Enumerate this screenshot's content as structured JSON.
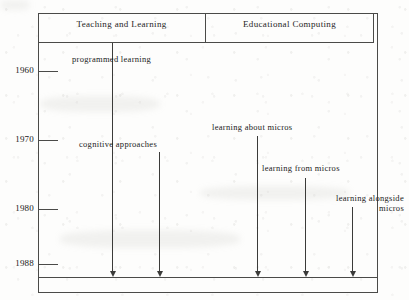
{
  "figure": {
    "type": "timeline-diagram",
    "columns": [
      {
        "id": "teaching-and-learning",
        "label": "Teaching and Learning"
      },
      {
        "id": "educational-computing",
        "label": "Educational Computing"
      }
    ],
    "axis": {
      "orientation": "vertical",
      "label": "",
      "ticks": [
        {
          "year": "1960",
          "y": 71
        },
        {
          "year": "1970",
          "y": 140
        },
        {
          "year": "1980",
          "y": 209
        },
        {
          "year": "1988",
          "y": 264
        }
      ],
      "range_start": "1960",
      "range_end": "1988"
    },
    "events": [
      {
        "id": "programmed-learning",
        "label": "programmed learning",
        "column": "teaching-and-learning",
        "start_year": "1954",
        "end_year": "1988",
        "stem_x": 112,
        "stem_top": 43,
        "stem_bottom": 271,
        "label_x": 72,
        "label_y": 54,
        "label_width": 100,
        "label_align": "lbl-left"
      },
      {
        "id": "cognitive-approaches",
        "label": "cognitive approaches",
        "column": "teaching-and-learning",
        "start_year": "1971",
        "end_year": "1988",
        "stem_x": 159,
        "stem_top": 152,
        "stem_bottom": 271,
        "label_x": 79,
        "label_y": 139,
        "label_width": 110,
        "label_align": "lbl-left"
      },
      {
        "id": "learning-about-micros",
        "label": "learning about micros",
        "column": "educational-computing",
        "start_year": "1969",
        "end_year": "1988",
        "stem_x": 257,
        "stem_top": 136,
        "stem_bottom": 271,
        "label_x": 212,
        "label_y": 122,
        "label_width": 110,
        "label_align": "lbl-left"
      },
      {
        "id": "learning-from-micros",
        "label": "learning from micros",
        "column": "educational-computing",
        "start_year": "1974",
        "end_year": "1988",
        "stem_x": 305,
        "stem_top": 178,
        "stem_bottom": 271,
        "label_x": 262,
        "label_y": 163,
        "label_width": 110,
        "label_align": "lbl-left"
      },
      {
        "id": "learning-alongside-micros",
        "label": "learning alongside\nmicros",
        "column": "educational-computing",
        "start_year": "1978",
        "end_year": "1988",
        "stem_x": 352,
        "stem_top": 207,
        "stem_bottom": 271,
        "label_x": 296,
        "label_y": 193,
        "label_width": 108,
        "label_align": "lbl-right"
      }
    ]
  },
  "colors": {
    "ink": "#3b3b39",
    "rule": "#4a4a48",
    "paper": "#fdfdfc"
  }
}
